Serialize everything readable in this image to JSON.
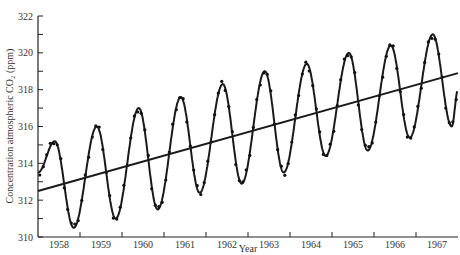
{
  "chart_data": {
    "type": "line",
    "title": "",
    "xlabel": "Year",
    "ylabel": "Concentration atmospheric CO₂ (ppm)",
    "ylim": [
      310,
      322
    ],
    "yticks": [
      310,
      312,
      314,
      316,
      318,
      320,
      322
    ],
    "xtick_labels": [
      "1958",
      "1959",
      "1960",
      "1961",
      "1962",
      "1963",
      "1964",
      "1965",
      "1966",
      "1967"
    ],
    "grid": false,
    "legend": null,
    "series": [
      {
        "name": "Monthly CO2 (smoothed seasonal curve)",
        "style": "line+points",
        "peaks": [
          {
            "year": 1958.4,
            "value": 315.2
          },
          {
            "year": 1959.4,
            "value": 316.0
          },
          {
            "year": 1960.4,
            "value": 317.0
          },
          {
            "year": 1961.4,
            "value": 317.6
          },
          {
            "year": 1962.4,
            "value": 318.3
          },
          {
            "year": 1963.4,
            "value": 319.0
          },
          {
            "year": 1964.4,
            "value": 319.4
          },
          {
            "year": 1965.4,
            "value": 320.0
          },
          {
            "year": 1966.4,
            "value": 320.4
          },
          {
            "year": 1967.4,
            "value": 321.0
          }
        ],
        "troughs": [
          {
            "year": 1958.85,
            "value": 310.5
          },
          {
            "year": 1959.85,
            "value": 311.0
          },
          {
            "year": 1960.85,
            "value": 311.5
          },
          {
            "year": 1961.85,
            "value": 312.4
          },
          {
            "year": 1962.85,
            "value": 312.9
          },
          {
            "year": 1963.85,
            "value": 313.5
          },
          {
            "year": 1964.85,
            "value": 314.4
          },
          {
            "year": 1965.85,
            "value": 314.7
          },
          {
            "year": 1966.85,
            "value": 315.4
          },
          {
            "year": 1967.85,
            "value": 316.0
          }
        ],
        "start": {
          "year": 1958.0,
          "value": 313.5
        },
        "end": {
          "year": 1968.0,
          "value": 318.0
        }
      },
      {
        "name": "Linear trend",
        "style": "line",
        "points": [
          {
            "year": 1958.0,
            "value": 312.5
          },
          {
            "year": 1968.0,
            "value": 318.9
          }
        ]
      }
    ]
  }
}
